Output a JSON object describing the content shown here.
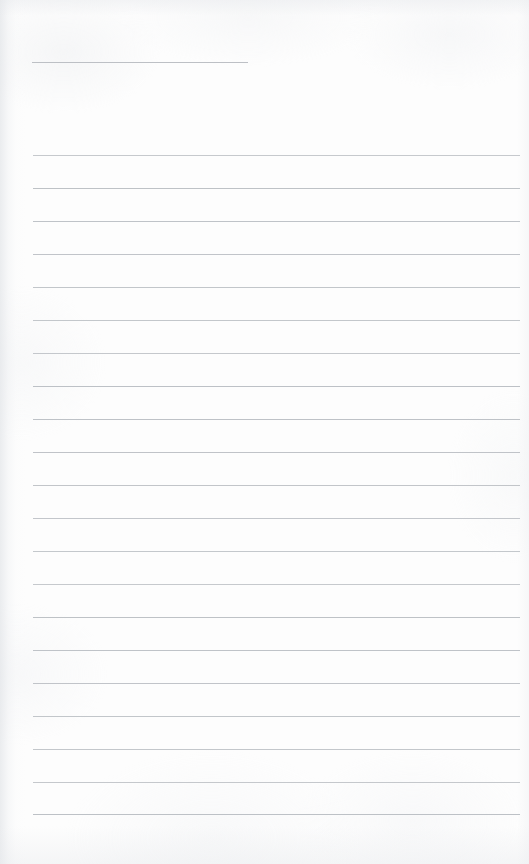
{
  "document": {
    "type": "scanned-lined-page",
    "title": "Blank ruled notebook page",
    "page_width": 529,
    "page_height": 864,
    "background_color": "#fdfdfd",
    "has_text_content": false,
    "visible_text": ""
  },
  "paper": {
    "base_color": "#fdfdfd",
    "texture_opacity": 0.55,
    "gutter_shadow_color": "#dee1e5",
    "edge_shadow_color": "#e7e9ec"
  },
  "rules": {
    "line_color": "#b9bdc2",
    "line_thickness_px": 1,
    "left_margin_px": 33,
    "right_edge_px": 520,
    "spacing_px": 33,
    "count": 22,
    "header_rule": {
      "label": "header-rule",
      "x": 32,
      "y": 62,
      "width": 216
    },
    "body_rules": [
      {
        "y": 155,
        "x": 33,
        "width": 487
      },
      {
        "y": 188,
        "x": 33,
        "width": 487
      },
      {
        "y": 221,
        "x": 33,
        "width": 487
      },
      {
        "y": 254,
        "x": 33,
        "width": 487
      },
      {
        "y": 287,
        "x": 33,
        "width": 487
      },
      {
        "y": 320,
        "x": 33,
        "width": 487
      },
      {
        "y": 353,
        "x": 33,
        "width": 487
      },
      {
        "y": 386,
        "x": 33,
        "width": 487
      },
      {
        "y": 419,
        "x": 33,
        "width": 487
      },
      {
        "y": 452,
        "x": 33,
        "width": 487
      },
      {
        "y": 485,
        "x": 33,
        "width": 487
      },
      {
        "y": 518,
        "x": 33,
        "width": 487
      },
      {
        "y": 551,
        "x": 33,
        "width": 487
      },
      {
        "y": 584,
        "x": 33,
        "width": 487
      },
      {
        "y": 617,
        "x": 33,
        "width": 487
      },
      {
        "y": 650,
        "x": 33,
        "width": 487
      },
      {
        "y": 683,
        "x": 33,
        "width": 487
      },
      {
        "y": 716,
        "x": 33,
        "width": 487
      },
      {
        "y": 749,
        "x": 33,
        "width": 487
      },
      {
        "y": 782,
        "x": 33,
        "width": 487
      },
      {
        "y": 814,
        "x": 33,
        "width": 487
      }
    ]
  }
}
